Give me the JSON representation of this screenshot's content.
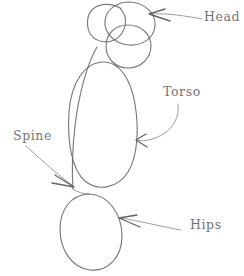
{
  "drawing": {
    "title": "Anatomy construction sketch of torso masses",
    "medium": "pencil sketch",
    "background_color": "#ffffff",
    "stroke_color": "#6f6f72",
    "label_color": "#6d6d71",
    "width": 244,
    "height": 276
  },
  "labels": {
    "head": "Head",
    "torso": "Torso",
    "spine": "Spine",
    "hips": "Hips"
  },
  "shapes": [
    {
      "name": "head-circle",
      "type": "ellipse",
      "cx": 109,
      "cy": 22,
      "rx": 21,
      "ry": 19,
      "rotation": -12
    },
    {
      "name": "head-cylinder-top-ellipse",
      "type": "ellipse",
      "cx": 130,
      "cy": 24,
      "rx": 25,
      "ry": 22,
      "rotation": -8
    },
    {
      "name": "head-cylinder-bottom-ellipse",
      "type": "ellipse",
      "cx": 128,
      "cy": 46,
      "rx": 23,
      "ry": 22,
      "rotation": -6
    },
    {
      "name": "torso-ellipse",
      "type": "ellipse",
      "cx": 102,
      "cy": 124,
      "rx": 34,
      "ry": 62,
      "rotation": 2
    },
    {
      "name": "hips-ellipse",
      "type": "ellipse",
      "cx": 91,
      "cy": 232,
      "rx": 31,
      "ry": 38,
      "rotation": -6
    },
    {
      "name": "spine-line",
      "type": "curve",
      "from": [
        96,
        48
      ],
      "to": [
        73,
        190
      ]
    }
  ],
  "annotations": [
    {
      "name": "head-annotation",
      "label": "Head",
      "arrow_tip": [
        149,
        14
      ],
      "arrow_tail": [
        203,
        19
      ]
    },
    {
      "name": "torso-annotation",
      "label": "Torso",
      "arrow_tip": [
        136,
        140
      ],
      "arrow_tail": [
        176,
        104
      ]
    },
    {
      "name": "spine-annotation",
      "label": "Spine",
      "arrow_tip": [
        74,
        186
      ],
      "arrow_tail": [
        27,
        147
      ]
    },
    {
      "name": "hips-annotation",
      "label": "Hips",
      "arrow_tip": [
        119,
        218
      ],
      "arrow_tail": [
        180,
        230
      ]
    }
  ]
}
